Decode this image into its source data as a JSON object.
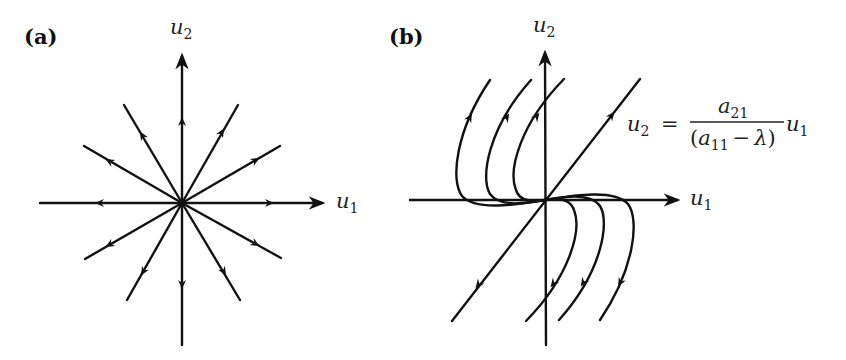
{
  "panels": {
    "a": {
      "label": "(a)",
      "x_axis": {
        "var": "u",
        "sub": "1"
      },
      "y_axis": {
        "var": "u",
        "sub": "2"
      },
      "description": "Star node (proper node): straight-line trajectories radiating outward from the origin in all directions"
    },
    "b": {
      "label": "(b)",
      "x_axis": {
        "var": "u",
        "sub": "1"
      },
      "y_axis": {
        "var": "u",
        "sub": "2"
      },
      "description": "Improper (degenerate) node: single eigenvector line with curved trajectories tangent to it at the origin",
      "equation": {
        "lhs_var": "u",
        "lhs_sub": "2",
        "equals": "=",
        "numerator_var": "a",
        "numerator_sub": "21",
        "denominator_open": "(",
        "denominator_var": "a",
        "denominator_sub": "11",
        "denominator_minus": "−",
        "denominator_lambda": "λ",
        "denominator_close": ")",
        "rhs_var": "u",
        "rhs_sub": "1"
      }
    }
  },
  "colors": {
    "ink": "#111111",
    "background": "#ffffff"
  }
}
